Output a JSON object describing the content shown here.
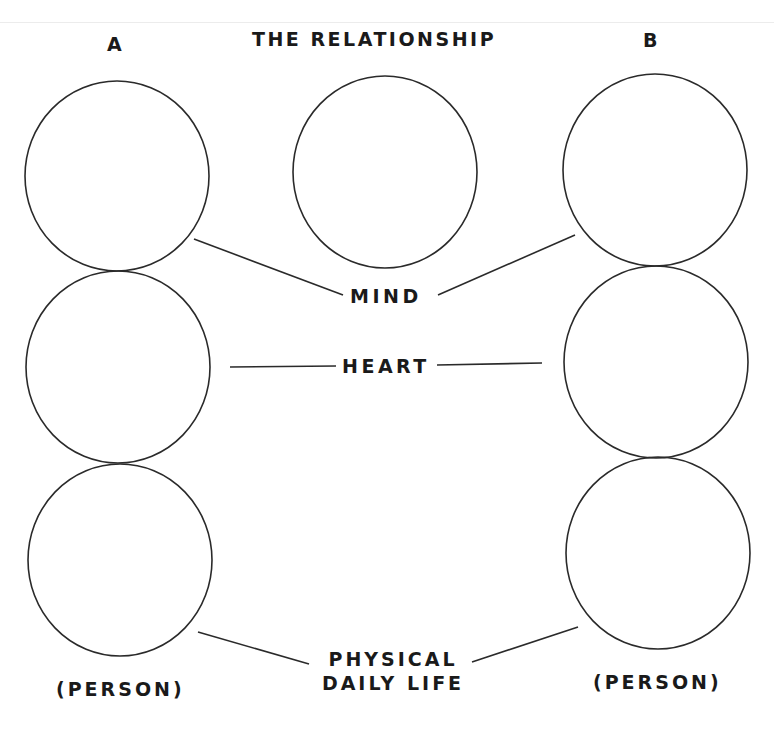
{
  "header": {
    "title": "THE RELATIONSHIP",
    "column_a": "A",
    "column_b": "B"
  },
  "dimensions": [
    {
      "id": "mind",
      "label": "MIND"
    },
    {
      "id": "heart",
      "label": "HEART"
    },
    {
      "id": "physical",
      "label_line1": "PHYSICAL",
      "label_line2": "DAILY LIFE"
    }
  ],
  "persons": {
    "a": {
      "label": "(PERSON)"
    },
    "b": {
      "label": "(PERSON)"
    }
  },
  "circles": {
    "a": [
      {
        "row": "mind",
        "cx": 117,
        "cy": 176,
        "r": 92
      },
      {
        "row": "heart",
        "cx": 118,
        "cy": 367,
        "r": 92
      },
      {
        "row": "physical",
        "cx": 120,
        "cy": 560,
        "r": 92
      }
    ],
    "relationship": {
      "cx": 385,
      "cy": 172,
      "r": 92
    },
    "b": [
      {
        "row": "mind",
        "cx": 655,
        "cy": 170,
        "r": 92
      },
      {
        "row": "heart",
        "cx": 656,
        "cy": 362,
        "r": 92
      },
      {
        "row": "physical",
        "cx": 658,
        "cy": 553,
        "r": 92
      }
    ]
  },
  "colors": {
    "stroke": "#2a2a2a",
    "text": "#1a1a1a",
    "background": "#ffffff"
  }
}
